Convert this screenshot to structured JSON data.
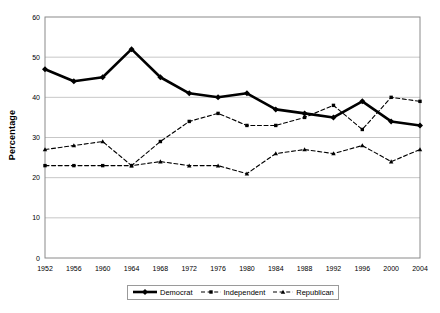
{
  "chart_data": {
    "type": "line",
    "title": "",
    "xlabel": "",
    "ylabel": "Percentage",
    "grid": true,
    "legend_position": "bottom",
    "xlim": [
      1952,
      2004
    ],
    "ylim": [
      0,
      60
    ],
    "ytick_interval": 10,
    "x": [
      1952,
      1956,
      1960,
      1964,
      1968,
      1972,
      1976,
      1980,
      1984,
      1988,
      1992,
      1996,
      2000,
      2004
    ],
    "categories": [
      "1952",
      "1956",
      "1960",
      "1964",
      "1968",
      "1972",
      "1976",
      "1980",
      "1984",
      "1988",
      "1992",
      "1996",
      "2000",
      "2004"
    ],
    "ytick_labels": [
      "0",
      "10",
      "20",
      "30",
      "40",
      "50",
      "60"
    ],
    "ytick_values": [
      0,
      10,
      20,
      30,
      40,
      50,
      60
    ],
    "series": [
      {
        "name": "Democrat",
        "color": "#000000",
        "style": "solid",
        "marker": "diamond",
        "width": 2.6,
        "values": [
          47,
          44,
          45,
          52,
          45,
          41,
          40,
          41,
          37,
          36,
          35,
          39,
          34,
          33
        ]
      },
      {
        "name": "Independent",
        "color": "#000000",
        "style": "dashed",
        "marker": "square",
        "width": 1.1,
        "values": [
          23,
          23,
          23,
          23,
          29,
          34,
          36,
          33,
          33,
          35,
          38,
          32,
          40,
          39
        ]
      },
      {
        "name": "Republican",
        "color": "#000000",
        "style": "dashed",
        "marker": "triangle",
        "width": 1.1,
        "values": [
          27,
          28,
          29,
          23,
          24,
          23,
          23,
          21,
          26,
          27,
          26,
          28,
          24,
          27
        ]
      }
    ]
  },
  "legend": {
    "items": [
      {
        "label": "Democrat",
        "key": "solid-diamond-key"
      },
      {
        "label": "Independent",
        "key": "dashed-square-key"
      },
      {
        "label": "Republican",
        "key": "dashed-triangle-key"
      }
    ]
  }
}
